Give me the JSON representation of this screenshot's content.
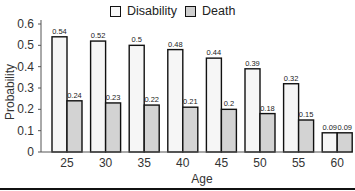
{
  "legend": {
    "items": [
      {
        "label": "Disability",
        "color": "#f2f2f2"
      },
      {
        "label": "Death",
        "color": "#d6d6d6"
      }
    ]
  },
  "axes": {
    "xlabel": "Age",
    "ylabel": "Probability",
    "yticks": [
      "0",
      "0.1",
      "0.2",
      "0.3",
      "0.4",
      "0.5",
      "0.6"
    ]
  },
  "chart_data": {
    "type": "bar",
    "title": "",
    "xlabel": "Age",
    "ylabel": "Probability",
    "categories": [
      "25",
      "30",
      "35",
      "40",
      "45",
      "50",
      "55",
      "60"
    ],
    "series": [
      {
        "name": "Disability",
        "values": [
          0.54,
          0.52,
          0.5,
          0.48,
          0.44,
          0.39,
          0.32,
          0.09
        ],
        "labels": [
          "0.54",
          "0.52",
          "0.5",
          "0.48",
          "0.44",
          "0.39",
          "0.32",
          "0.09"
        ],
        "color": "#f2f2f2"
      },
      {
        "name": "Death",
        "values": [
          0.24,
          0.23,
          0.22,
          0.21,
          0.2,
          0.18,
          0.15,
          0.09
        ],
        "labels": [
          "0.24",
          "0.23",
          "0.22",
          "0.21",
          "0.2",
          "0.18",
          "0.15",
          "0.09"
        ],
        "color": "#d6d6d6"
      }
    ],
    "ylim": [
      0,
      0.6
    ],
    "yticks": [
      0,
      0.1,
      0.2,
      0.3,
      0.4,
      0.5,
      0.6
    ],
    "grid": false,
    "legend_position": "top"
  }
}
